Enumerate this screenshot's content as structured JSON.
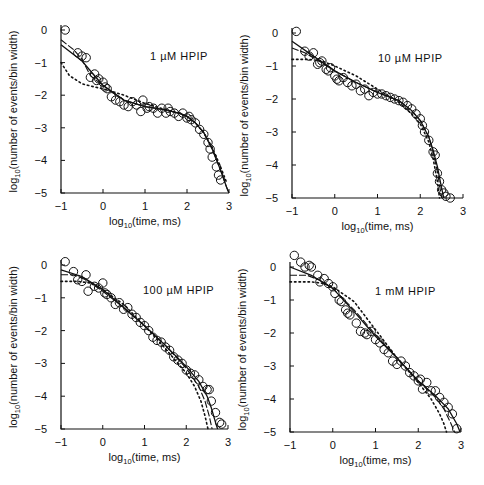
{
  "figure": {
    "panels_layout": "2x2 grid",
    "shared": {
      "xlabel": "log10(time, ms)",
      "xlabel_main": "log",
      "xlabel_sub": "10",
      "xlabel_rest": "(time, ms)",
      "ylabel_main": "log",
      "ylabel_sub": "10",
      "ylabel_rest": "(number of events/bin width)",
      "x_ticks": [
        "-1",
        "0",
        "1",
        "2",
        "3"
      ],
      "y_ticks": [
        "0",
        "-1",
        "-2",
        "-3",
        "-4",
        "-5"
      ]
    }
  },
  "chart_data": [
    {
      "type": "scatter",
      "title": "1 µM HPIP",
      "title_parts": {
        "conc": "1",
        "unit": "µM",
        "name": "HPIP"
      },
      "xlabel": "log10(time, ms)",
      "ylabel": "log10(number of events/bin width)",
      "xlim": [
        -1,
        3
      ],
      "ylim": [
        -5,
        0
      ],
      "x_ticks": [
        -1,
        0,
        1,
        2,
        3
      ],
      "y_ticks": [
        0,
        -1,
        -2,
        -3,
        -4,
        -5
      ],
      "grid": false,
      "frame_px": {
        "x0": 61,
        "x1": 229,
        "y0": 30,
        "y5": 193
      },
      "label_px": {
        "x": 150,
        "y": 60
      },
      "points": {
        "x": [
          -0.9,
          -0.6,
          -0.5,
          -0.4,
          -0.3,
          -0.2,
          -0.15,
          -0.1,
          0.0,
          0.05,
          0.1,
          0.2,
          0.3,
          0.4,
          0.5,
          0.6,
          0.7,
          0.8,
          0.9,
          0.95,
          1.05,
          1.1,
          1.2,
          1.3,
          1.4,
          1.5,
          1.55,
          1.6,
          1.7,
          1.8,
          1.9,
          2.0,
          2.05,
          2.1,
          2.2,
          2.3,
          2.4,
          2.5,
          2.55,
          2.6,
          2.7,
          2.75,
          2.8
        ],
        "y": [
          0.0,
          -0.7,
          -0.8,
          -0.85,
          -1.45,
          -1.35,
          -1.55,
          -1.5,
          -1.6,
          -1.75,
          -1.8,
          -2.05,
          -2.15,
          -2.2,
          -2.3,
          -2.35,
          -2.2,
          -2.3,
          -2.5,
          -2.15,
          -2.4,
          -2.35,
          -2.4,
          -2.55,
          -2.4,
          -2.55,
          -2.4,
          -2.5,
          -2.55,
          -2.65,
          -2.55,
          -2.7,
          -2.65,
          -2.75,
          -2.85,
          -3.05,
          -3.2,
          -3.45,
          -3.65,
          -3.9,
          -4.2,
          -4.45,
          -4.6
        ]
      },
      "series": [
        {
          "name": "fit-solid",
          "style": "solid",
          "x": [
            -1,
            -0.5,
            0,
            0.5,
            1,
            1.5,
            1.8,
            2.0,
            2.2,
            2.4,
            2.6,
            2.8,
            2.95,
            3.0
          ],
          "y": [
            -0.45,
            -0.95,
            -1.7,
            -2.15,
            -2.35,
            -2.45,
            -2.55,
            -2.65,
            -2.85,
            -3.15,
            -3.65,
            -4.3,
            -4.85,
            -5.0
          ]
        },
        {
          "name": "fit-dashed",
          "style": "dashed",
          "x": [
            -1,
            -0.7,
            -0.5,
            -0.3,
            0,
            0.5,
            1,
            1.5,
            1.8,
            2.0,
            2.2,
            2.4,
            2.6,
            2.8,
            2.95,
            3.0
          ],
          "y": [
            -0.3,
            -0.6,
            -0.9,
            -1.4,
            -1.7,
            -2.15,
            -2.35,
            -2.45,
            -2.55,
            -2.65,
            -2.85,
            -3.15,
            -3.65,
            -4.3,
            -4.85,
            -5.0
          ]
        },
        {
          "name": "fit-dotted",
          "style": "dotted",
          "x": [
            -1,
            -0.8,
            -0.5,
            -0.2,
            0,
            0.5,
            1,
            1.5,
            1.8,
            2.0,
            2.2,
            2.4,
            2.6,
            2.8,
            2.95
          ],
          "y": [
            -1.0,
            -1.4,
            -1.65,
            -1.75,
            -1.8,
            -2.0,
            -2.25,
            -2.45,
            -2.55,
            -2.65,
            -2.85,
            -3.15,
            -3.6,
            -4.2,
            -4.7
          ]
        }
      ]
    },
    {
      "type": "scatter",
      "title": "10 µM HPIP",
      "title_parts": {
        "conc": "10",
        "unit": "µM",
        "name": "HPIP"
      },
      "xlabel": "log10(time, ms)",
      "ylabel": "log10(number of events/bin width)",
      "xlim": [
        -1,
        3
      ],
      "ylim": [
        -5,
        0
      ],
      "x_ticks": [
        -1,
        0,
        1,
        2,
        3
      ],
      "y_ticks": [
        0,
        -1,
        -2,
        -3,
        -4,
        -5
      ],
      "grid": false,
      "frame_px": {
        "x0": 292,
        "x1": 463,
        "y0": 33,
        "y5": 198
      },
      "label_px": {
        "x": 378,
        "y": 62
      },
      "points": {
        "x": [
          -0.9,
          -0.7,
          -0.6,
          -0.5,
          -0.4,
          -0.35,
          -0.3,
          -0.2,
          -0.15,
          -0.1,
          0.0,
          0.05,
          0.1,
          0.2,
          0.3,
          0.4,
          0.5,
          0.6,
          0.7,
          0.8,
          0.9,
          1.0,
          1.1,
          1.2,
          1.3,
          1.4,
          1.5,
          1.6,
          1.7,
          1.8,
          1.9,
          2.0,
          2.05,
          2.1,
          2.2,
          2.3,
          2.35,
          2.4,
          2.45,
          2.5,
          2.55,
          2.6,
          2.7
        ],
        "y": [
          0.05,
          -0.55,
          -0.7,
          -0.6,
          -0.95,
          -0.9,
          -0.85,
          -1.1,
          -1.15,
          -1.05,
          -1.3,
          -1.4,
          -1.45,
          -1.35,
          -1.5,
          -1.6,
          -1.55,
          -1.75,
          -1.7,
          -1.9,
          -1.8,
          -1.85,
          -1.85,
          -1.9,
          -1.95,
          -2.0,
          -2.05,
          -2.1,
          -2.2,
          -2.3,
          -2.45,
          -2.6,
          -2.8,
          -3.0,
          -3.25,
          -3.6,
          -3.7,
          -4.25,
          -4.5,
          -4.75,
          -4.85,
          -4.95,
          -5.0
        ]
      },
      "series": [
        {
          "name": "fit-solid",
          "style": "solid",
          "x": [
            -1,
            -0.5,
            0,
            0.5,
            1,
            1.5,
            1.8,
            2.0,
            2.2,
            2.3,
            2.4,
            2.5,
            2.55
          ],
          "y": [
            -0.25,
            -0.7,
            -1.15,
            -1.5,
            -1.8,
            -2.05,
            -2.35,
            -2.65,
            -3.15,
            -3.55,
            -4.05,
            -4.7,
            -5.0
          ]
        },
        {
          "name": "fit-dashed",
          "style": "dashed",
          "x": [
            -1,
            -0.7,
            -0.3,
            0,
            0.5,
            1,
            1.5,
            1.8,
            2.0,
            2.2,
            2.3,
            2.4,
            2.5
          ],
          "y": [
            -0.45,
            -0.6,
            -0.9,
            -1.15,
            -1.5,
            -1.8,
            -2.05,
            -2.35,
            -2.65,
            -3.15,
            -3.6,
            -4.2,
            -5.0
          ]
        },
        {
          "name": "fit-dotted",
          "style": "dotted",
          "x": [
            -1,
            -0.6,
            -0.3,
            0,
            0.5,
            1,
            1.5,
            1.8,
            2.0,
            2.2,
            2.3,
            2.4,
            2.45
          ],
          "y": [
            -0.8,
            -0.8,
            -0.85,
            -1.0,
            -1.3,
            -1.7,
            -2.1,
            -2.45,
            -2.75,
            -3.3,
            -3.8,
            -4.5,
            -5.0
          ]
        }
      ]
    },
    {
      "type": "scatter",
      "title": "100 µM HPIP",
      "title_parts": {
        "conc": "100",
        "unit": "µM",
        "name": "HPIP"
      },
      "xlabel": "log10(time, ms)",
      "ylabel": "log10(number of events/bin width)",
      "xlim": [
        -1,
        3
      ],
      "ylim": [
        -5,
        0
      ],
      "x_ticks": [
        -1,
        0,
        1,
        2,
        3
      ],
      "y_ticks": [
        0,
        -1,
        -2,
        -3,
        -4,
        -5
      ],
      "grid": false,
      "frame_px": {
        "x0": 61,
        "x1": 228,
        "y0": 265,
        "y5": 429
      },
      "label_px": {
        "x": 143,
        "y": 294
      },
      "points": {
        "x": [
          -0.9,
          -0.7,
          -0.6,
          -0.5,
          -0.4,
          -0.35,
          -0.2,
          -0.1,
          0.0,
          0.05,
          0.1,
          0.2,
          0.3,
          0.4,
          0.5,
          0.6,
          0.7,
          0.8,
          0.9,
          1.0,
          1.1,
          1.2,
          1.3,
          1.4,
          1.5,
          1.6,
          1.7,
          1.8,
          1.9,
          2.0,
          2.1,
          2.2,
          2.3,
          2.4,
          2.5,
          2.55,
          2.6,
          2.7,
          2.8,
          2.85
        ],
        "y": [
          0.1,
          -0.2,
          -0.45,
          -0.5,
          -0.3,
          -0.8,
          -0.65,
          -0.7,
          -0.55,
          -0.85,
          -0.9,
          -1.0,
          -1.2,
          -1.15,
          -1.35,
          -1.3,
          -1.5,
          -1.6,
          -1.75,
          -1.85,
          -2.0,
          -2.2,
          -2.3,
          -2.35,
          -2.5,
          -2.6,
          -2.8,
          -2.9,
          -3.0,
          -3.2,
          -3.3,
          -3.35,
          -3.5,
          -3.7,
          -3.8,
          -3.8,
          -4.15,
          -4.5,
          -4.8,
          -4.85
        ]
      },
      "series": [
        {
          "name": "fit-solid",
          "style": "solid",
          "x": [
            -1,
            -0.5,
            0,
            0.5,
            1,
            1.5,
            2.0,
            2.3,
            2.5,
            2.6,
            2.7,
            2.75
          ],
          "y": [
            -0.15,
            -0.35,
            -0.75,
            -1.3,
            -1.85,
            -2.45,
            -3.1,
            -3.55,
            -4.0,
            -4.35,
            -4.8,
            -5.0
          ]
        },
        {
          "name": "fit-dashed",
          "style": "dashed",
          "x": [
            -1,
            -0.7,
            -0.4,
            0,
            0.5,
            1,
            1.5,
            2.0,
            2.3,
            2.45,
            2.55,
            2.62
          ],
          "y": [
            -0.3,
            -0.3,
            -0.45,
            -0.8,
            -1.3,
            -1.85,
            -2.45,
            -3.15,
            -3.7,
            -4.15,
            -4.6,
            -5.0
          ]
        },
        {
          "name": "fit-dotted",
          "style": "dotted",
          "x": [
            -1,
            -0.6,
            -0.3,
            0,
            0.5,
            1,
            1.5,
            2.0,
            2.2,
            2.35,
            2.45,
            2.52
          ],
          "y": [
            -0.5,
            -0.5,
            -0.55,
            -0.75,
            -1.2,
            -1.85,
            -2.55,
            -3.3,
            -3.7,
            -4.15,
            -4.6,
            -5.0
          ]
        }
      ]
    },
    {
      "type": "scatter",
      "title": "1 mM HPIP",
      "title_parts": {
        "conc": "1",
        "unit": "mM",
        "name": "HPIP"
      },
      "xlabel": "log10(time, ms)",
      "ylabel": "log10(number of events/bin width)",
      "xlim": [
        -1,
        3
      ],
      "ylim": [
        -5,
        0
      ],
      "x_ticks": [
        -1,
        0,
        1,
        2,
        3
      ],
      "y_ticks": [
        0,
        -1,
        -2,
        -3,
        -4,
        -5
      ],
      "grid": false,
      "frame_px": {
        "x0": 290,
        "x1": 461,
        "y0": 267,
        "y5": 432
      },
      "label_px": {
        "x": 375,
        "y": 295
      },
      "points": {
        "x": [
          -0.9,
          -0.75,
          -0.65,
          -0.55,
          -0.5,
          -0.35,
          -0.3,
          -0.2,
          -0.1,
          0.0,
          0.05,
          0.15,
          0.2,
          0.3,
          0.35,
          0.4,
          0.55,
          0.65,
          0.75,
          0.8,
          0.9,
          1.0,
          1.1,
          1.2,
          1.3,
          1.4,
          1.5,
          1.6,
          1.7,
          1.8,
          1.9,
          2.0,
          2.05,
          2.1,
          2.2,
          2.3,
          2.4,
          2.5,
          2.6,
          2.7,
          2.8,
          2.9
        ],
        "y": [
          0.35,
          0.15,
          0.0,
          0.05,
          0.0,
          -0.25,
          -0.45,
          -0.35,
          -0.5,
          -0.6,
          -0.8,
          -1.0,
          -1.05,
          -1.3,
          -1.4,
          -1.45,
          -1.7,
          -1.95,
          -2.0,
          -2.05,
          -1.95,
          -2.2,
          -2.3,
          -2.5,
          -2.6,
          -2.85,
          -2.95,
          -2.85,
          -3.0,
          -3.2,
          -3.3,
          -3.45,
          -3.4,
          -3.7,
          -3.5,
          -3.75,
          -3.75,
          -3.95,
          -4.1,
          -4.25,
          -4.45,
          -4.9
        ]
      },
      "series": [
        {
          "name": "fit-solid",
          "style": "solid",
          "x": [
            -1,
            -0.5,
            0,
            0.5,
            1,
            1.5,
            2.0,
            2.4,
            2.7,
            2.9,
            2.98
          ],
          "y": [
            0.0,
            -0.25,
            -0.65,
            -1.35,
            -2.1,
            -2.75,
            -3.45,
            -3.9,
            -4.3,
            -4.75,
            -5.0
          ]
        },
        {
          "name": "fit-dashed",
          "style": "dashed",
          "x": [
            -1,
            -0.6,
            -0.3,
            0,
            0.5,
            1,
            1.5,
            2.0,
            2.4,
            2.6,
            2.75,
            2.85
          ],
          "y": [
            -0.25,
            -0.25,
            -0.4,
            -0.65,
            -1.3,
            -2.05,
            -2.75,
            -3.45,
            -3.95,
            -4.3,
            -4.7,
            -5.0
          ]
        },
        {
          "name": "fit-dotted",
          "style": "dotted",
          "x": [
            -1,
            -0.5,
            -0.2,
            0,
            0.5,
            1,
            1.5,
            2.0,
            2.3,
            2.5,
            2.6,
            2.66
          ],
          "y": [
            -0.45,
            -0.45,
            -0.5,
            -0.6,
            -1.05,
            -1.9,
            -2.75,
            -3.5,
            -4.0,
            -4.45,
            -4.75,
            -5.0
          ]
        }
      ]
    }
  ]
}
